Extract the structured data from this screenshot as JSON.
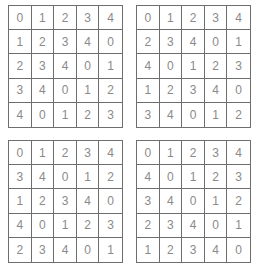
{
  "page": {
    "background_color": "#ffffff",
    "grid_line_color": "#6e6e6e",
    "digit_color": "#8a8a8a"
  },
  "grids": [
    {
      "name": "grid-top-left",
      "rows": [
        [
          "0",
          "1",
          "2",
          "3",
          "4"
        ],
        [
          "1",
          "2",
          "3",
          "4",
          "0"
        ],
        [
          "2",
          "3",
          "4",
          "0",
          "1"
        ],
        [
          "3",
          "4",
          "0",
          "1",
          "2"
        ],
        [
          "4",
          "0",
          "1",
          "2",
          "3"
        ]
      ]
    },
    {
      "name": "grid-top-right",
      "rows": [
        [
          "0",
          "1",
          "2",
          "3",
          "4"
        ],
        [
          "2",
          "3",
          "4",
          "0",
          "1"
        ],
        [
          "4",
          "0",
          "1",
          "2",
          "3"
        ],
        [
          "1",
          "2",
          "3",
          "4",
          "0"
        ],
        [
          "3",
          "4",
          "0",
          "1",
          "2"
        ]
      ]
    },
    {
      "name": "grid-bottom-left",
      "rows": [
        [
          "0",
          "1",
          "2",
          "3",
          "4"
        ],
        [
          "3",
          "4",
          "0",
          "1",
          "2"
        ],
        [
          "1",
          "2",
          "3",
          "4",
          "0"
        ],
        [
          "4",
          "0",
          "1",
          "2",
          "3"
        ],
        [
          "2",
          "3",
          "4",
          "0",
          "1"
        ]
      ]
    },
    {
      "name": "grid-bottom-right",
      "rows": [
        [
          "0",
          "1",
          "2",
          "3",
          "4"
        ],
        [
          "4",
          "0",
          "1",
          "2",
          "3"
        ],
        [
          "3",
          "4",
          "0",
          "1",
          "2"
        ],
        [
          "2",
          "3",
          "4",
          "0",
          "1"
        ],
        [
          "1",
          "2",
          "3",
          "4",
          "0"
        ]
      ]
    }
  ]
}
